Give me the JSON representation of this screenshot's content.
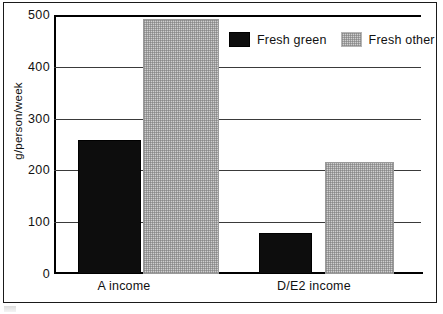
{
  "chart_data": {
    "type": "bar",
    "title": "",
    "xlabel": "",
    "ylabel": "g/person/week",
    "categories": [
      "A income",
      "D/E2 income"
    ],
    "series": [
      {
        "name": "Fresh green",
        "values": [
          258,
          80
        ],
        "color": "#0d0d0d"
      },
      {
        "name": "Fresh other",
        "values": [
          493,
          216
        ],
        "color": "#cfcfcf"
      }
    ],
    "ylim": [
      0,
      500
    ],
    "yticks": [
      0,
      100,
      200,
      300,
      400,
      500
    ],
    "ytick_labels": [
      "0",
      "100",
      "200",
      "300",
      "400",
      "500"
    ],
    "grid": true,
    "legend_position": "top-right"
  },
  "axes": {
    "y_title": "g/person/week",
    "y_ticks": [
      {
        "label": "500",
        "value": 500
      },
      {
        "label": "400",
        "value": 400
      },
      {
        "label": "300",
        "value": 300
      },
      {
        "label": "200",
        "value": 200
      },
      {
        "label": "100",
        "value": 100
      },
      {
        "label": "0",
        "value": 0
      }
    ],
    "x_ticks": [
      {
        "label": "A income"
      },
      {
        "label": "D/E2 income"
      }
    ]
  },
  "legend": {
    "entries": [
      {
        "label": "Fresh green",
        "swatch": "black"
      },
      {
        "label": "Fresh other",
        "swatch": "gray"
      }
    ]
  },
  "bars": [
    {
      "name": "a-income-fresh-green",
      "group": "A income",
      "series": "Fresh green",
      "value": 258,
      "left": 24,
      "width": 63,
      "style": "black"
    },
    {
      "name": "a-income-fresh-other",
      "group": "A income",
      "series": "Fresh other",
      "value": 493,
      "left": 89,
      "width": 76,
      "style": "gray"
    },
    {
      "name": "de2-income-fresh-green",
      "group": "D/E2 income",
      "series": "Fresh green",
      "value": 80,
      "left": 205,
      "width": 53,
      "style": "black"
    },
    {
      "name": "de2-income-fresh-other",
      "group": "D/E2 income",
      "series": "Fresh other",
      "value": 216,
      "left": 271,
      "width": 69,
      "style": "gray"
    }
  ]
}
